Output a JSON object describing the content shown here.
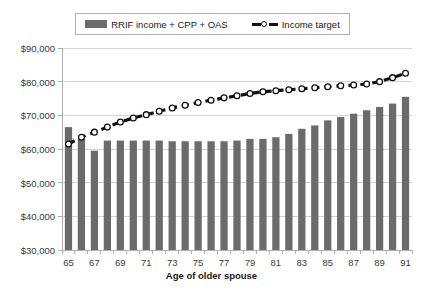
{
  "legend": {
    "position": "top",
    "entries": [
      {
        "label": "RRIF income + CPP + OAS",
        "type": "bar",
        "color": "#6b6b6b"
      },
      {
        "label": "Income target",
        "type": "line",
        "color": "#111111",
        "marker": "white-circle"
      }
    ]
  },
  "axes": {
    "x_title": "Age of older spouse",
    "y_title": "",
    "y_ticks": [
      "$30,000",
      "$40,000",
      "$50,000",
      "$60,000",
      "$70,000",
      "$80,000",
      "$90,000"
    ],
    "x_ticks": [
      "65",
      "67",
      "69",
      "71",
      "73",
      "75",
      "77",
      "79",
      "81",
      "83",
      "85",
      "87",
      "89",
      "91"
    ]
  },
  "colors": {
    "bar": "#6b6b6b",
    "line": "#111111",
    "marker_fill": "#ffffff",
    "grid": "#d4d4d4",
    "axis": "#b0b0b0",
    "text": "#3a3a3a",
    "background": "#ffffff"
  },
  "chart_data": {
    "type": "bar",
    "title": "",
    "subtitle": "",
    "xlabel": "Age of older spouse",
    "ylabel": "",
    "ylim": [
      30000,
      90000
    ],
    "ytick_step": 10000,
    "grid": true,
    "legend_position": "top",
    "categories": [
      65,
      66,
      67,
      68,
      69,
      70,
      71,
      72,
      73,
      74,
      75,
      76,
      77,
      78,
      79,
      80,
      81,
      82,
      83,
      84,
      85,
      86,
      87,
      88,
      89,
      90,
      91
    ],
    "series": [
      {
        "name": "RRIF income + CPP + OAS",
        "type": "bar",
        "color": "#6b6b6b",
        "values": [
          66500,
          63000,
          59500,
          62500,
          62500,
          62500,
          62500,
          62500,
          62300,
          62300,
          62300,
          62300,
          62300,
          62500,
          63000,
          63000,
          63500,
          64500,
          66000,
          67000,
          68500,
          69500,
          70500,
          71500,
          72500,
          73500,
          75500
        ]
      },
      {
        "name": "Income target",
        "type": "line",
        "color": "#111111",
        "marker": "white-circle",
        "dashed": true,
        "values": [
          61500,
          63500,
          65000,
          66500,
          68000,
          69200,
          70200,
          71200,
          72200,
          73000,
          73800,
          74500,
          75200,
          75800,
          76500,
          77000,
          77300,
          77600,
          77900,
          78200,
          78500,
          78800,
          79000,
          79300,
          80000,
          81200,
          82500
        ]
      }
    ]
  }
}
